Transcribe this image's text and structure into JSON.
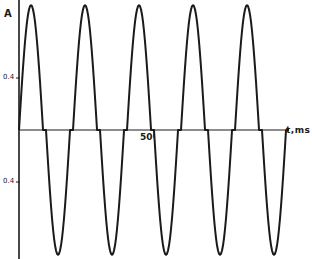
{
  "chart_data": {
    "type": "line",
    "title": "",
    "xlabel": "t,ms",
    "ylabel": "A",
    "grid": false,
    "legend": null,
    "x_ticks": [
      {
        "value": 50,
        "label": "50"
      }
    ],
    "y_ticks": [
      {
        "value": 0.4,
        "label": "0.4"
      },
      {
        "value": -0.4,
        "label": "0.4"
      }
    ],
    "xlim": [
      0,
      59
    ],
    "ylim": [
      -1.0,
      0.96
    ],
    "waveform": {
      "description": "Chopped sinusoidal current: half-sine pulses alternating positive/negative with short zero-current gaps",
      "period_ms": 20,
      "frequency_hz": 50,
      "pulse_width_ms": 8.9,
      "gap_ms": 1.1,
      "positive_peak_A": 0.96,
      "negative_peak_A": -0.96,
      "positive_pulse_count": 5,
      "negative_pulse_count": 5
    },
    "series": [
      {
        "name": "current",
        "points_summary": [
          {
            "t_ms": 0.0,
            "i_A": 0
          },
          {
            "t_ms": 4.4,
            "i_A": 0.96
          },
          {
            "t_ms": 8.9,
            "i_A": 0
          },
          {
            "t_ms": 10.0,
            "i_A": 0
          },
          {
            "t_ms": 14.4,
            "i_A": -0.96
          },
          {
            "t_ms": 18.9,
            "i_A": 0
          },
          {
            "t_ms": 20.0,
            "i_A": 0
          },
          {
            "t_ms": 24.4,
            "i_A": 0.96
          },
          {
            "t_ms": 28.9,
            "i_A": 0
          },
          {
            "t_ms": 30.0,
            "i_A": 0
          },
          {
            "t_ms": 34.4,
            "i_A": -0.96
          },
          {
            "t_ms": 38.9,
            "i_A": 0
          },
          {
            "t_ms": 40.0,
            "i_A": 0
          },
          {
            "t_ms": 44.4,
            "i_A": 0.96
          },
          {
            "t_ms": 48.9,
            "i_A": 0
          },
          {
            "t_ms": 50.0,
            "i_A": 0
          },
          {
            "t_ms": 54.4,
            "i_A": -0.96
          },
          {
            "t_ms": 58.9,
            "i_A": 0
          }
        ]
      }
    ]
  },
  "labels": {
    "y_axis": "A",
    "x_axis": "t,ms",
    "tick_50": "50",
    "tick_pos_04": "0.4",
    "tick_neg_04": "0.4"
  },
  "layout": {
    "origin_px": [
      19,
      130
    ],
    "px_per_ms": 2.7,
    "px_per_A": 130,
    "axis_top_px": 0,
    "axis_bottom_px": 259,
    "axis_right_px": 285,
    "stroke_color": "#1a1a1a"
  }
}
